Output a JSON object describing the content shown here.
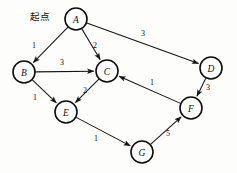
{
  "diagram": {
    "type": "directed-weighted-graph",
    "title_annotation": "起点",
    "annotation_position": {
      "x": 30,
      "y": 9
    },
    "size": {
      "width": 237,
      "height": 173
    },
    "colors": {
      "background": "#fdfdfb",
      "stroke": "#141414",
      "node_fill": "#ffffff",
      "node_stroke": "#0d0d0d",
      "text": "#101010"
    },
    "node_radius": 11,
    "nodes": [
      {
        "id": "A",
        "label": "A",
        "x": 76,
        "y": 19
      },
      {
        "id": "B",
        "label": "B",
        "x": 24,
        "y": 72
      },
      {
        "id": "C",
        "label": "C",
        "x": 107,
        "y": 71
      },
      {
        "id": "D",
        "label": "D",
        "x": 211,
        "y": 68
      },
      {
        "id": "E",
        "label": "E",
        "x": 66,
        "y": 112
      },
      {
        "id": "F",
        "label": "F",
        "x": 191,
        "y": 108
      },
      {
        "id": "G",
        "label": "G",
        "x": 142,
        "y": 152
      }
    ],
    "edges": [
      {
        "id": "A-B",
        "from": "A",
        "to": "B",
        "weight": "1",
        "label_x": 34,
        "label_y": 45
      },
      {
        "id": "A-C",
        "from": "A",
        "to": "C",
        "weight": "2",
        "label_x": 95,
        "label_y": 45
      },
      {
        "id": "A-D",
        "from": "A",
        "to": "D",
        "weight": "3",
        "label_x": 143,
        "label_y": 33
      },
      {
        "id": "B-C",
        "from": "B",
        "to": "C",
        "weight": "3",
        "label_x": 62,
        "label_y": 62
      },
      {
        "id": "B-E",
        "from": "B",
        "to": "E",
        "weight": "1",
        "label_x": 35,
        "label_y": 97
      },
      {
        "id": "C-E",
        "from": "C",
        "to": "E",
        "weight": "2",
        "label_x": 85,
        "label_y": 90
      },
      {
        "id": "D-F",
        "from": "D",
        "to": "F",
        "weight": "3",
        "label_x": 208,
        "label_y": 87
      },
      {
        "id": "F-C",
        "from": "F",
        "to": "C",
        "weight": "1",
        "label_x": 152,
        "label_y": 82
      },
      {
        "id": "E-G",
        "from": "E",
        "to": "G",
        "weight": "1",
        "label_x": 96,
        "label_y": 138
      },
      {
        "id": "G-F",
        "from": "G",
        "to": "F",
        "weight": "5",
        "label_x": 168,
        "label_y": 133
      }
    ]
  }
}
